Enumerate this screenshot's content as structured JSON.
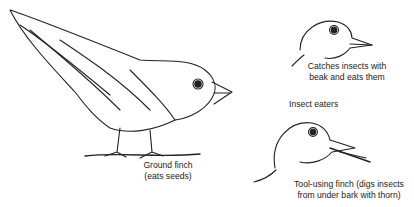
{
  "figure": {
    "ground_finch": {
      "line1": "Ground finch",
      "line2": "(eats seeds)"
    },
    "insect_catcher": {
      "line1": "Catches insects with",
      "line2": "beak and eats them"
    },
    "group_label": "Insect eaters",
    "tool_finch": {
      "line1": "Tool-using finch (digs insects",
      "line2": "from under bark with thorn)"
    }
  }
}
